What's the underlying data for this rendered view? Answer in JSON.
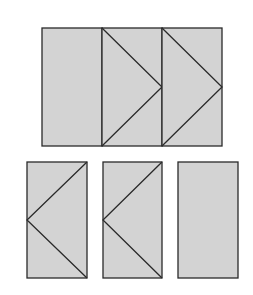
{
  "diagram": {
    "colors": {
      "fill": "#d3d3d3",
      "stroke": "#2a2a2a",
      "background": "#ffffff"
    },
    "top_row": {
      "pieces": [
        {
          "id": "top-plain",
          "x": 42,
          "y": 28,
          "w": 60,
          "h": 118,
          "pattern": "plain"
        },
        {
          "id": "top-arrow-right-1",
          "x": 102,
          "y": 28,
          "w": 60,
          "h": 118,
          "pattern": "chevron-right"
        },
        {
          "id": "top-arrow-right-2",
          "x": 162,
          "y": 28,
          "w": 60,
          "h": 118,
          "pattern": "chevron-right"
        }
      ]
    },
    "bottom_row": {
      "pieces": [
        {
          "id": "bottom-arrow-left-1",
          "x": 27,
          "y": 162,
          "w": 60,
          "h": 116,
          "pattern": "chevron-left"
        },
        {
          "id": "bottom-arrow-left-2",
          "x": 103,
          "y": 162,
          "w": 59,
          "h": 116,
          "pattern": "chevron-left"
        },
        {
          "id": "bottom-plain",
          "x": 178,
          "y": 162,
          "w": 60,
          "h": 116,
          "pattern": "plain"
        }
      ]
    }
  }
}
